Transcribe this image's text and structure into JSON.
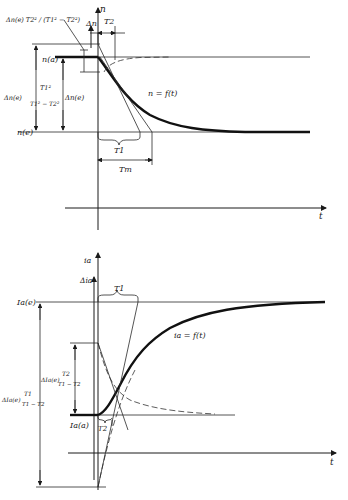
{
  "top_diagram": {
    "axis_labels": {
      "vertical_1": "n",
      "vertical_2": "Δn",
      "horizontal": "t"
    },
    "levels": {
      "initial": "n(a)",
      "final": "n(e)"
    },
    "curve_label": "n = f(t)",
    "time_constants": {
      "t1": "T1",
      "t2": "T2",
      "tm": "Tm"
    },
    "annotations": {
      "overshoot": "Δn(e) T2² / (T1² − T2²)",
      "left_term_prefix": "Δn(e)",
      "left_term_num": "T1²",
      "left_term_den": "T1² − T2²",
      "delta": "Δn(e)"
    }
  },
  "bottom_diagram": {
    "axis_labels": {
      "vertical_1": "ia",
      "vertical_2": "Δia",
      "horizontal": "t"
    },
    "levels": {
      "initial": "Ia(a)",
      "final": "Ia(e)"
    },
    "curve_label": "ia = f(t)",
    "time_constants": {
      "t1": "T1",
      "t2": "T2"
    },
    "annotations": {
      "upper_prefix": "ΔIa(e)",
      "upper_num": "T2",
      "upper_den": "T1 − T2",
      "lower_prefix": "ΔIa(e)",
      "lower_num": "T1",
      "lower_den": "T1 − T2"
    }
  }
}
